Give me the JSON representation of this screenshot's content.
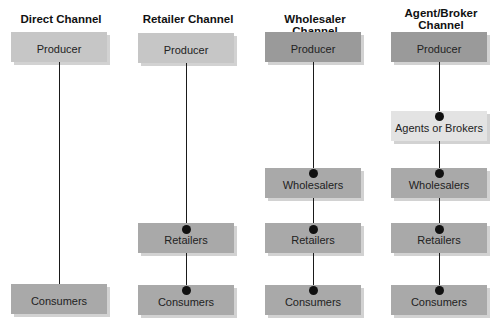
{
  "columns": [
    {
      "title": "Direct Channel",
      "nodes": [
        "Producer",
        "Consumers"
      ]
    },
    {
      "title": "Retailer Channel",
      "nodes": [
        "Producer",
        "Retailers",
        "Consumers"
      ]
    },
    {
      "title": "Wholesaler Channel",
      "nodes": [
        "Producer",
        "Wholesalers",
        "Retailers",
        "Consumers"
      ]
    },
    {
      "title": "Agent/Broker Channel",
      "title_lines": [
        "Agent/Broker",
        "Channel"
      ],
      "nodes": [
        "Producer",
        "Agents or Brokers",
        "Wholesalers",
        "Retailers",
        "Consumers"
      ]
    }
  ],
  "colors": {
    "producer_light": "#c6c6c6",
    "producer_dark": "#9a9a9a",
    "intermediary": "#a9a9a9",
    "agents": "#e3e3e3",
    "connector": "#1a1a1a"
  }
}
